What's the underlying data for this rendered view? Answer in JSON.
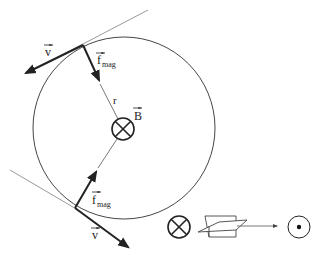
{
  "diagram": {
    "colors": {
      "stroke": "#222222",
      "thin_line": "#555555",
      "tangent_line": "#999999",
      "background": "#ffffff"
    },
    "circle": {
      "cx": 124,
      "cy": 128,
      "r": 91
    },
    "labels": {
      "velocity": "v",
      "force_main": "f",
      "force_sub": "mag",
      "radius": "r",
      "field": "B"
    },
    "top_point": {
      "contact": [
        83,
        45
      ],
      "velocity_tip": [
        24,
        74
      ],
      "force_tip": [
        100,
        82
      ],
      "tangent_end": [
        148,
        10
      ]
    },
    "bottom_point": {
      "contact": [
        75,
        208
      ],
      "velocity_tip": [
        130,
        248
      ],
      "force_tip": [
        97,
        170
      ],
      "tangent_start": [
        10,
        170
      ]
    },
    "field_symbol_center": {
      "type": "into-page",
      "cx": 123,
      "cy": 129,
      "r": 11
    },
    "legend": {
      "into_page_symbol": "⊗",
      "out_of_page_symbol": "⊙",
      "description": "rotation into page → out of page"
    }
  }
}
